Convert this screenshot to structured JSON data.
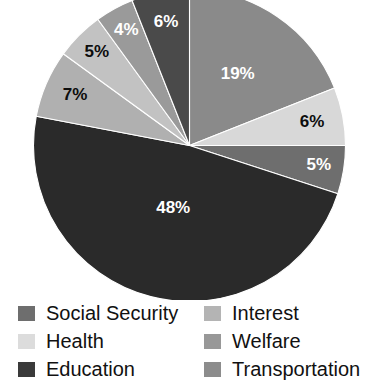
{
  "chart_data": {
    "type": "pie",
    "title": "",
    "subtitle": "",
    "xlabel": "",
    "ylabel": "",
    "legend_position": "bottom",
    "grid": false,
    "start_angle_deg": 0,
    "direction": "clockwise",
    "categories": [
      "Interest",
      "Health",
      "Welfare",
      "Education",
      "Transportation",
      "Welfare",
      "Interest",
      "Social Security"
    ],
    "values": [
      19,
      6,
      5,
      48,
      7,
      5,
      4,
      6
    ],
    "labels": [
      "19%",
      "6%",
      "5%",
      "48%",
      "7%",
      "5%",
      "4%",
      "6%"
    ],
    "colors": [
      "#8a8a8a",
      "#d8d8d8",
      "#6e6e6e",
      "#2a2a2a",
      "#b0b0b0",
      "#c2c2c2",
      "#9a9a9a",
      "#4a4a4a"
    ],
    "label_colors": [
      "light",
      "dark",
      "light",
      "light",
      "dark",
      "dark",
      "light",
      "light"
    ],
    "slices": [
      {
        "label": "19%",
        "value": 19,
        "color": "#8a8a8a",
        "text": "light"
      },
      {
        "label": "6%",
        "value": 6,
        "color": "#d8d8d8",
        "text": "dark"
      },
      {
        "label": "5%",
        "value": 5,
        "color": "#6e6e6e",
        "text": "light"
      },
      {
        "label": "48%",
        "value": 48,
        "color": "#2a2a2a",
        "text": "light"
      },
      {
        "label": "7%",
        "value": 7,
        "color": "#b0b0b0",
        "text": "dark"
      },
      {
        "label": "5%",
        "value": 5,
        "color": "#c2c2c2",
        "text": "dark"
      },
      {
        "label": "4%",
        "value": 4,
        "color": "#9a9a9a",
        "text": "light"
      },
      {
        "label": "6%",
        "value": 6,
        "color": "#4a4a4a",
        "text": "light"
      }
    ]
  },
  "legend": {
    "columns": [
      {
        "items": [
          {
            "label": "Social Security",
            "color": "#6e6e6e"
          },
          {
            "label": "Health",
            "color": "#dcdcdc"
          },
          {
            "label": "Education",
            "color": "#3a3a3a"
          }
        ]
      },
      {
        "items": [
          {
            "label": "Interest",
            "color": "#b4b4b4"
          },
          {
            "label": "Welfare",
            "color": "#989898"
          },
          {
            "label": "Transportation",
            "color": "#8c8c8c"
          }
        ]
      }
    ]
  }
}
